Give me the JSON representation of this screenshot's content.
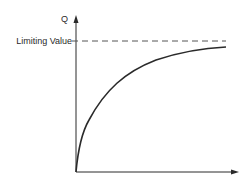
{
  "diagram": {
    "y_axis_label": "Q",
    "x_axis_label": "",
    "asymptote_label": "Limiting Value",
    "curve": "saturating growth rising steeply from origin and approaching the limiting value",
    "colors": {
      "line": "#2a2a2a",
      "background": "#ffffff"
    }
  }
}
